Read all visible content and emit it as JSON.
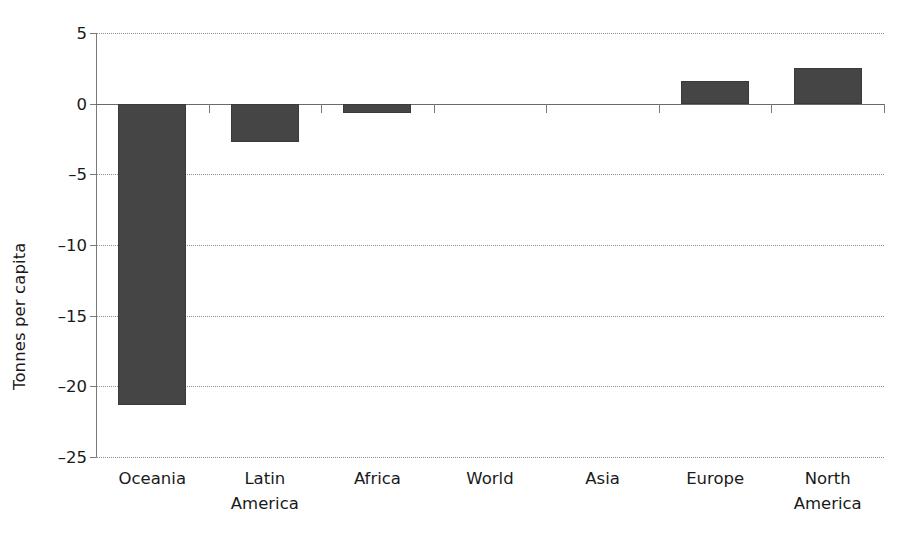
{
  "chart_data": {
    "type": "bar",
    "title": "",
    "subtitle": "",
    "xlabel": "",
    "ylabel": "Tonnes per capita",
    "categories": [
      "Oceania",
      "Latin\nAmerica",
      "Africa",
      "World",
      "Asia",
      "Europe",
      "North\nAmerica"
    ],
    "values": [
      -21.3,
      -2.7,
      -0.65,
      0,
      0,
      1.6,
      2.55
    ],
    "ylim": [
      -25,
      5
    ],
    "yticks": [
      5,
      0,
      -5,
      -10,
      -15,
      -20,
      -25
    ],
    "ytick_labels": [
      "5",
      "0",
      "–5",
      "–10",
      "–15",
      "–20",
      "–25"
    ],
    "grid": true,
    "grid_axis": "y",
    "legend": null,
    "series": [
      {
        "name": "Tonnes per capita",
        "values": [
          -21.3,
          -2.7,
          -0.65,
          0,
          0,
          1.6,
          2.55
        ]
      }
    ],
    "colors": {
      "bar_fill": "#454545",
      "bar_edge": "#3a3a3a",
      "gridline": "#8e8e8e",
      "axis": "#7a7a7a",
      "text": "#1a1a1a",
      "background": "#ffffff"
    }
  }
}
